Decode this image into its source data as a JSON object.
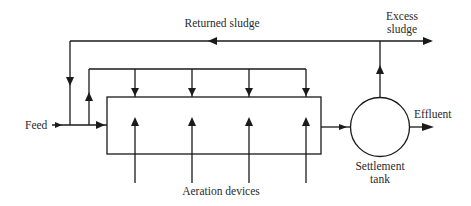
{
  "diagram": {
    "type": "process-flow",
    "labels": {
      "returned_sludge": "Returned sludge",
      "excess_sludge_line1": "Excess",
      "excess_sludge_line2": "sludge",
      "feed": "Feed",
      "effluent": "Effluent",
      "settlement_line1": "Settlement",
      "settlement_line2": "tank",
      "aeration": "Aeration devices"
    },
    "nodes": [
      {
        "id": "aeration-tank",
        "shape": "rectangle"
      },
      {
        "id": "settlement-tank",
        "shape": "circle"
      }
    ],
    "edges": [
      {
        "from": "feed",
        "to": "aeration-tank"
      },
      {
        "from": "aeration-tank",
        "to": "settlement-tank"
      },
      {
        "from": "settlement-tank",
        "to": "effluent"
      },
      {
        "from": "settlement-tank",
        "to": "excess-sludge"
      },
      {
        "from": "settlement-tank",
        "to": "feed",
        "label": "Returned sludge"
      },
      {
        "from": "feed-split",
        "to": "aeration-tank",
        "note": "step feed at 4 points"
      },
      {
        "from": "aeration-devices",
        "to": "aeration-tank",
        "note": "4 aeration inputs"
      }
    ],
    "colors": {
      "line": "#1a1a1a",
      "text": "#2a2a2a",
      "background": "#ffffff"
    }
  }
}
